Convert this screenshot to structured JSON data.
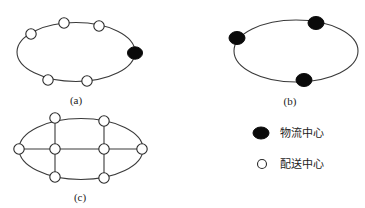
{
  "figure": {
    "panels": [
      {
        "id": "a",
        "caption": "(a)",
        "ring": {
          "cx": 76,
          "cy": 52,
          "rx": 59,
          "ry": 29.5
        },
        "nodes": [
          {
            "x": 31,
            "y": 34,
            "type": "distribution"
          },
          {
            "x": 64,
            "y": 23,
            "type": "distribution"
          },
          {
            "x": 99,
            "y": 26,
            "type": "distribution"
          },
          {
            "x": 135,
            "y": 53,
            "type": "logistics"
          },
          {
            "x": 48,
            "y": 80,
            "type": "distribution"
          },
          {
            "x": 87,
            "y": 81,
            "type": "distribution"
          }
        ]
      },
      {
        "id": "b",
        "caption": "(b)",
        "ring": {
          "cx": 296,
          "cy": 51,
          "rx": 62,
          "ry": 31
        },
        "nodes": [
          {
            "x": 237,
            "y": 38,
            "type": "logistics"
          },
          {
            "x": 316,
            "y": 23,
            "type": "logistics"
          },
          {
            "x": 304,
            "y": 80,
            "type": "logistics"
          }
        ]
      },
      {
        "id": "c",
        "caption": "(c)",
        "ring": {
          "cx": 81,
          "cy": 149,
          "rx": 63,
          "ry": 31
        },
        "lines": [
          {
            "x1": 19,
            "y1": 149,
            "x2": 142,
            "y2": 149
          },
          {
            "x1": 55,
            "y1": 118,
            "x2": 55,
            "y2": 177
          },
          {
            "x1": 104,
            "y1": 121,
            "x2": 104,
            "y2": 178
          }
        ],
        "nodes": [
          {
            "x": 55,
            "y": 118,
            "type": "distribution"
          },
          {
            "x": 104,
            "y": 121,
            "type": "distribution"
          },
          {
            "x": 19,
            "y": 149,
            "type": "distribution"
          },
          {
            "x": 55,
            "y": 149,
            "type": "distribution"
          },
          {
            "x": 104,
            "y": 149,
            "type": "distribution"
          },
          {
            "x": 142,
            "y": 149,
            "type": "distribution"
          },
          {
            "x": 55,
            "y": 177,
            "type": "distribution"
          },
          {
            "x": 104,
            "y": 178,
            "type": "distribution"
          }
        ]
      }
    ],
    "legend": [
      {
        "type": "logistics",
        "label": "物流中心",
        "icon": "filled-black-ellipse"
      },
      {
        "type": "distribution",
        "label": "配送中心",
        "icon": "hollow-white-circle"
      }
    ]
  }
}
